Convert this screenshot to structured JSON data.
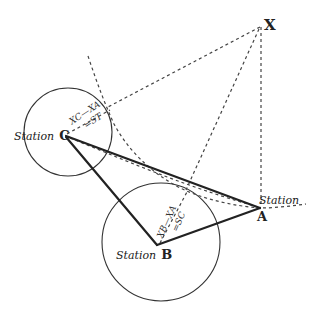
{
  "diagram": {
    "title": "",
    "points": {
      "X": {
        "label": "X",
        "x": 261,
        "y": 26
      },
      "A": {
        "label": "A",
        "prefix": "Station",
        "x": 260,
        "y": 208
      },
      "B": {
        "label": "B",
        "prefix": "Station",
        "x": 157,
        "y": 245
      },
      "C": {
        "label": "C",
        "prefix": "Station",
        "x": 65,
        "y": 137
      }
    },
    "circles": {
      "C": {
        "cx": 68,
        "cy": 132,
        "r": 44
      },
      "B": {
        "cx": 161,
        "cy": 242,
        "r": 59
      }
    },
    "annotations": {
      "C_formula_line1": "XC—XA",
      "C_formula_line2": "=ST",
      "B_formula_line1": "XB—XA",
      "B_formula_line2": "=SC"
    },
    "colors": {
      "ink": "#222222",
      "background": "#ffffff"
    }
  }
}
